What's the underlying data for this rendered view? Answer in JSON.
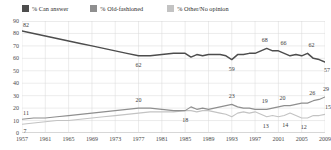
{
  "legend": {
    "items": [
      {
        "label": "% Can answer",
        "color": "#4d4d4d",
        "key": "can_answer"
      },
      {
        "label": "% Old-fashioned",
        "color": "#8f8f8f",
        "key": "old_fashioned"
      },
      {
        "label": "% Other/No opinion",
        "color": "#c3c3c3",
        "key": "other_no_opinion"
      }
    ]
  },
  "chart_data": {
    "type": "line",
    "title": "",
    "subtitle": "",
    "xlabel": "",
    "ylabel": "",
    "xlim": [
      1957,
      2009
    ],
    "ylim": [
      0,
      90
    ],
    "ytick_step": 10,
    "grid": true,
    "legend_position": "top",
    "yticks": [
      90,
      80,
      70,
      60,
      50,
      40,
      30,
      20,
      10,
      0
    ],
    "xticks": [
      1957,
      1961,
      1965,
      1969,
      1973,
      1977,
      1981,
      1985,
      1989,
      1993,
      1997,
      2001,
      2005,
      2009
    ],
    "series": [
      {
        "name": "% Can answer",
        "color": "#4d4d4d",
        "x": [
          1957,
          1959,
          1961,
          1963,
          1965,
          1967,
          1969,
          1971,
          1973,
          1975,
          1977,
          1979,
          1981,
          1983,
          1985,
          1986,
          1987,
          1988,
          1989,
          1990,
          1991,
          1992,
          1993,
          1994,
          1995,
          1996,
          1997,
          1998,
          1999,
          2000,
          2001,
          2002,
          2003,
          2004,
          2005,
          2006,
          2007,
          2008,
          2009
        ],
        "values": [
          82,
          80,
          78,
          76,
          74,
          72,
          70,
          68,
          66,
          64,
          62,
          62,
          63,
          64,
          64,
          61,
          63,
          62,
          63,
          63,
          63,
          62,
          59,
          63,
          63,
          64,
          64,
          66,
          68,
          66,
          66,
          64,
          62,
          63,
          62,
          64,
          60,
          59,
          57
        ]
      },
      {
        "name": "% Old-fashioned",
        "color": "#8f8f8f",
        "x": [
          1957,
          1959,
          1961,
          1963,
          1965,
          1967,
          1969,
          1971,
          1973,
          1975,
          1977,
          1979,
          1981,
          1983,
          1985,
          1986,
          1987,
          1988,
          1989,
          1990,
          1991,
          1992,
          1993,
          1994,
          1995,
          1996,
          1997,
          1998,
          1999,
          2000,
          2001,
          2002,
          2003,
          2004,
          2005,
          2006,
          2007,
          2008,
          2009
        ],
        "values": [
          11,
          12,
          12,
          13,
          14,
          15,
          16,
          17,
          18,
          19,
          20,
          20,
          19,
          18,
          18,
          21,
          19,
          20,
          19,
          20,
          21,
          22,
          23,
          21,
          20,
          20,
          19,
          19,
          19,
          20,
          21,
          22,
          22,
          23,
          24,
          24,
          26,
          27,
          29
        ]
      },
      {
        "name": "% Other/No opinion",
        "color": "#c3c3c3",
        "x": [
          1957,
          1959,
          1961,
          1963,
          1965,
          1967,
          1969,
          1971,
          1973,
          1975,
          1977,
          1979,
          1981,
          1983,
          1985,
          1986,
          1987,
          1988,
          1989,
          1990,
          1991,
          1992,
          1993,
          1994,
          1995,
          1996,
          1997,
          1998,
          1999,
          2000,
          2001,
          2002,
          2003,
          2004,
          2005,
          2006,
          2007,
          2008,
          2009
        ],
        "values": [
          7,
          8,
          9,
          10,
          10,
          11,
          12,
          13,
          14,
          15,
          16,
          17,
          17,
          17,
          18,
          18,
          17,
          18,
          18,
          17,
          16,
          15,
          13,
          16,
          17,
          16,
          17,
          15,
          13,
          14,
          13,
          14,
          16,
          14,
          12,
          12,
          14,
          14,
          15
        ]
      }
    ],
    "point_labels": [
      {
        "series": "% Can answer",
        "x": 1957,
        "value": 82,
        "text": "82",
        "dx": 4,
        "dy": -6
      },
      {
        "series": "% Can answer",
        "x": 1977,
        "value": 62,
        "text": "62",
        "dx": 0,
        "dy": 9
      },
      {
        "series": "% Can answer",
        "x": 1993,
        "value": 59,
        "text": "59",
        "dx": 0,
        "dy": 9
      },
      {
        "series": "% Can answer",
        "x": 1999,
        "value": 68,
        "text": "68",
        "dx": -2,
        "dy": -8
      },
      {
        "series": "% Can answer",
        "x": 2001,
        "value": 66,
        "text": "66",
        "dx": 5,
        "dy": -8
      },
      {
        "series": "% Can answer",
        "x": 2006,
        "value": 64,
        "text": "62",
        "dx": 4,
        "dy": -8
      },
      {
        "series": "% Can answer",
        "x": 2009,
        "value": 57,
        "text": "57",
        "dx": 2,
        "dy": 8
      },
      {
        "series": "% Old-fashioned",
        "x": 1957,
        "value": 11,
        "text": "11",
        "dx": 4,
        "dy": -6
      },
      {
        "series": "% Old-fashioned",
        "x": 1977,
        "value": 20,
        "text": "20",
        "dx": 0,
        "dy": -8
      },
      {
        "series": "% Old-fashioned",
        "x": 1993,
        "value": 23,
        "text": "23",
        "dx": 0,
        "dy": -8
      },
      {
        "series": "% Old-fashioned",
        "x": 1999,
        "value": 19,
        "text": "19",
        "dx": -2,
        "dy": -8
      },
      {
        "series": "% Old-fashioned",
        "x": 2001,
        "value": 21,
        "text": "20",
        "dx": 4,
        "dy": -9
      },
      {
        "series": "% Old-fashioned",
        "x": 2007,
        "value": 26,
        "text": "26",
        "dx": -1,
        "dy": -8
      },
      {
        "series": "% Old-fashioned",
        "x": 2009,
        "value": 29,
        "text": "29",
        "dx": 1,
        "dy": -8
      },
      {
        "series": "% Other/No opinion",
        "x": 1957,
        "value": 7,
        "text": "7",
        "dx": 3,
        "dy": 7
      },
      {
        "series": "% Other/No opinion",
        "x": 1985,
        "value": 18,
        "text": "18",
        "dx": 0,
        "dy": 9
      },
      {
        "series": "% Other/No opinion",
        "x": 1999,
        "value": 13,
        "text": "13",
        "dx": -1,
        "dy": 9
      },
      {
        "series": "% Other/No opinion",
        "x": 2002,
        "value": 14,
        "text": "14",
        "dx": 1,
        "dy": 9
      },
      {
        "series": "% Other/No opinion",
        "x": 2005,
        "value": 12,
        "text": "12",
        "dx": 2,
        "dy": 9
      },
      {
        "series": "% Other/No opinion",
        "x": 2009,
        "value": 15,
        "text": "15",
        "dx": 3,
        "dy": -7
      }
    ]
  }
}
